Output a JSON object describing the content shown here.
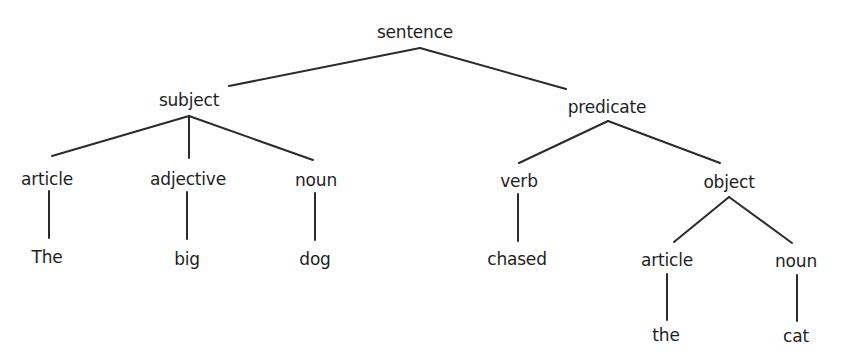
{
  "diagram": {
    "type": "parse-tree",
    "root": {
      "label": "sentence",
      "children": [
        {
          "label": "subject",
          "children": [
            {
              "label": "article",
              "children": [
                {
                  "label": "The"
                }
              ]
            },
            {
              "label": "adjective",
              "children": [
                {
                  "label": "big"
                }
              ]
            },
            {
              "label": "noun",
              "children": [
                {
                  "label": "dog"
                }
              ]
            }
          ]
        },
        {
          "label": "predicate",
          "children": [
            {
              "label": "verb",
              "children": [
                {
                  "label": "chased"
                }
              ]
            },
            {
              "label": "object",
              "children": [
                {
                  "label": "article",
                  "children": [
                    {
                      "label": "the"
                    }
                  ]
                },
                {
                  "label": "noun",
                  "children": [
                    {
                      "label": "cat"
                    }
                  ]
                }
              ]
            }
          ]
        }
      ]
    },
    "nodes": {
      "sentence": "sentence",
      "subject": "subject",
      "predicate": "predicate",
      "subject_article": "article",
      "subject_adjective": "adjective",
      "subject_noun": "noun",
      "predicate_verb": "verb",
      "predicate_object": "object",
      "object_article": "article",
      "object_noun": "noun",
      "word_the_cap": "The",
      "word_big": "big",
      "word_dog": "dog",
      "word_chased": "chased",
      "word_the": "the",
      "word_cat": "cat"
    },
    "line_color": "#2a2a2a",
    "text_color": "#1e1e1e"
  }
}
